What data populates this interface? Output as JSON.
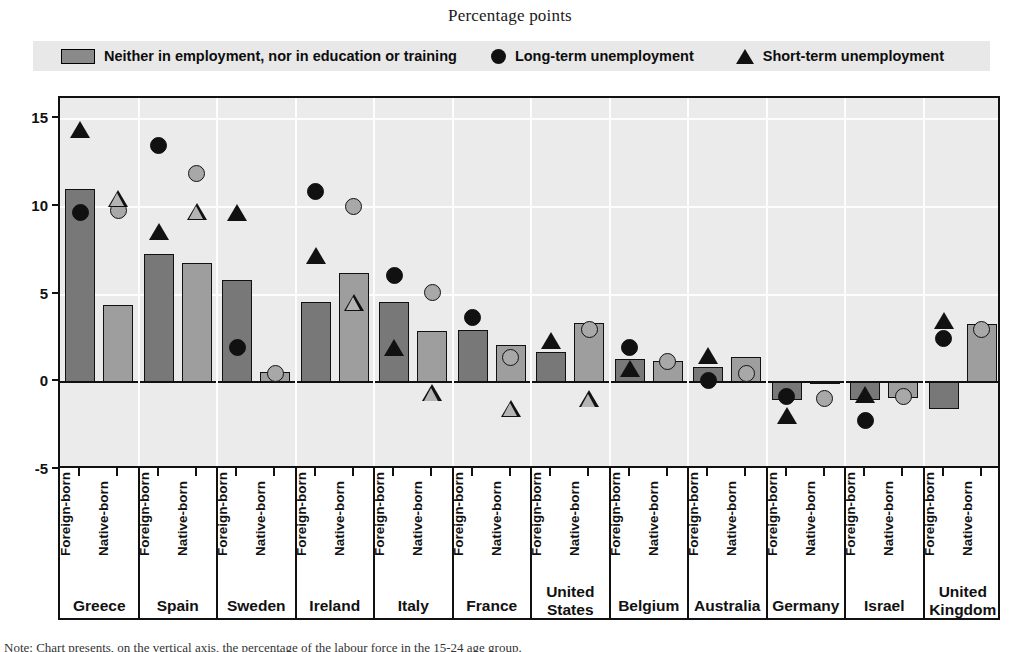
{
  "chart": {
    "title": "Percentage points",
    "footnote": "Note: Chart presents, on the vertical axis, the percentage of the labour force in the 15-24 age group."
  },
  "legend": {
    "position": "top",
    "items": [
      {
        "label": "Neither in employment, nor in education or training",
        "icon": "square-swatch"
      },
      {
        "label": "Long-term unemployment",
        "icon": "circle-marker"
      },
      {
        "label": "Short-term unemployment",
        "icon": "triangle-marker"
      }
    ]
  },
  "yaxis": {
    "ticks": [
      "15",
      "10",
      "5",
      "0",
      "-5"
    ],
    "min": -5,
    "max": 16.2
  },
  "group_labels": {
    "foreign": "Foreign-born",
    "native": "Native-born"
  },
  "chart_data": {
    "type": "bar",
    "title": "Percentage points",
    "xlabel": "",
    "ylabel": "Percentage points",
    "ylim": [
      -5,
      16.2
    ],
    "yticks": [
      -5,
      0,
      5,
      10,
      15
    ],
    "grid": true,
    "legend_position": "top",
    "categories": [
      "Greece",
      "Spain",
      "Sweden",
      "Ireland",
      "Italy",
      "France",
      "United States",
      "Belgium",
      "Australia",
      "Germany",
      "Israel",
      "United Kingdom"
    ],
    "subgroups": [
      "Foreign-born",
      "Native-born"
    ],
    "series": [
      {
        "name": "Neither in employment, nor in education or training",
        "marker": "bar",
        "foreign_born": [
          11.0,
          7.3,
          5.8,
          4.6,
          4.6,
          3.0,
          1.7,
          1.3,
          0.85,
          -1.0,
          -1.0,
          -1.5
        ],
        "native_born": [
          4.4,
          6.8,
          0.6,
          6.2,
          2.9,
          2.1,
          3.4,
          1.2,
          1.45,
          -0.1,
          -0.9,
          3.3
        ]
      },
      {
        "name": "Long-term unemployment",
        "marker": "circle",
        "foreign_born": [
          9.7,
          13.5,
          2.0,
          10.9,
          6.1,
          3.7,
          null,
          2.0,
          0.1,
          -0.8,
          -2.2,
          2.5
        ],
        "native_born": [
          9.8,
          11.9,
          0.5,
          10.0,
          5.1,
          1.4,
          3.0,
          1.2,
          0.5,
          -0.9,
          -0.8,
          3.0
        ]
      },
      {
        "name": "Short-term unemployment",
        "marker": "triangle",
        "foreign_born": [
          14.4,
          8.6,
          9.7,
          7.2,
          2.0,
          null,
          2.4,
          0.8,
          1.5,
          -1.9,
          -0.7,
          3.5
        ],
        "native_born": [
          10.5,
          10.7,
          null,
          6.5,
          2.3,
          2.4,
          3.9,
          -0.2,
          0.7,
          -0.7,
          -0.7,
          3.6
        ]
      }
    ]
  }
}
